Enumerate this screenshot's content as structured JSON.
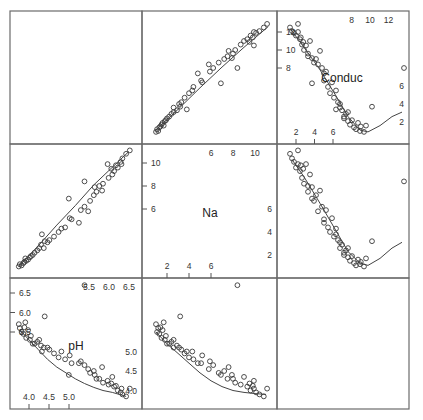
{
  "chart_data": {
    "type": "scatter",
    "subtype": "scatterplot-matrix",
    "title": "",
    "variables": [
      "Conduc",
      "Na",
      "pH"
    ],
    "diagonal_labels": [
      "Conduc",
      "Na",
      "pH"
    ],
    "smoother": "loess curve in each off-diagonal panel",
    "axes": {
      "Conduc": {
        "ticks_bottom": [
          "2",
          "4",
          "6"
        ],
        "ticks_top": [
          "8",
          "10",
          "12"
        ],
        "ticks_left": [
          "8",
          "10",
          "12"
        ],
        "ticks_right": [
          "2",
          "4",
          "6"
        ],
        "range": [
          0.5,
          13.5
        ]
      },
      "Na": {
        "ticks_bottom": [
          "2",
          "4",
          "6"
        ],
        "ticks_top": [
          "6",
          "8",
          "10"
        ],
        "ticks_left": [
          "6",
          "8",
          "10"
        ],
        "ticks_right": [
          "2",
          "4",
          "6"
        ],
        "range": [
          0.7,
          11.5
        ]
      },
      "pH": {
        "ticks_bottom": [
          "4.0",
          "4.5",
          "5.0"
        ],
        "ticks_top": [
          "5.5",
          "6.0",
          "6.5"
        ],
        "ticks_left": [
          "5.5",
          "6.0",
          "6.5"
        ],
        "ticks_right": [
          "4.0",
          "4.5",
          "5.0"
        ],
        "range": [
          3.7,
          6.8
        ]
      }
    },
    "observations": [
      {
        "pH": 3.85,
        "Na": 10.8,
        "Conduc": 12.5
      },
      {
        "pH": 3.9,
        "Na": 10.4,
        "Conduc": 12.1
      },
      {
        "pH": 3.95,
        "Na": 10.1,
        "Conduc": 11.9
      },
      {
        "pH": 4.0,
        "Na": 9.6,
        "Conduc": 11.6
      },
      {
        "pH": 4.05,
        "Na": 11.1,
        "Conduc": 12.9
      },
      {
        "pH": 4.05,
        "Na": 9.9,
        "Conduc": 12.0
      },
      {
        "pH": 4.1,
        "Na": 9.3,
        "Conduc": 11.2
      },
      {
        "pH": 4.12,
        "Na": 9.8,
        "Conduc": 11.4
      },
      {
        "pH": 4.15,
        "Na": 8.7,
        "Conduc": 10.6
      },
      {
        "pH": 4.18,
        "Na": 9.5,
        "Conduc": 10.9
      },
      {
        "pH": 4.2,
        "Na": 8.2,
        "Conduc": 10.0
      },
      {
        "pH": 4.25,
        "Na": 9.9,
        "Conduc": 10.5
      },
      {
        "pH": 4.3,
        "Na": 8.0,
        "Conduc": 9.6
      },
      {
        "pH": 4.3,
        "Na": 7.5,
        "Conduc": 9.3
      },
      {
        "pH": 4.35,
        "Na": 9.0,
        "Conduc": 11.0
      },
      {
        "pH": 4.4,
        "Na": 7.9,
        "Conduc": 9.1
      },
      {
        "pH": 4.45,
        "Na": 6.7,
        "Conduc": 8.6
      },
      {
        "pH": 4.5,
        "Na": 7.2,
        "Conduc": 9.0
      },
      {
        "pH": 4.55,
        "Na": 5.8,
        "Conduc": 8.4
      },
      {
        "pH": 4.6,
        "Na": 7.6,
        "Conduc": 9.9
      },
      {
        "pH": 4.65,
        "Na": 6.2,
        "Conduc": 8.0
      },
      {
        "pH": 4.7,
        "Na": 5.1,
        "Conduc": 6.6
      },
      {
        "pH": 4.75,
        "Na": 5.9,
        "Conduc": 7.6
      },
      {
        "pH": 4.8,
        "Na": 4.4,
        "Conduc": 5.9
      },
      {
        "pH": 4.85,
        "Na": 4.0,
        "Conduc": 5.2
      },
      {
        "pH": 4.9,
        "Na": 5.2,
        "Conduc": 6.4
      },
      {
        "pH": 4.95,
        "Na": 3.6,
        "Conduc": 4.7
      },
      {
        "pH": 5.0,
        "Na": 4.3,
        "Conduc": 5.5
      },
      {
        "pH": 5.05,
        "Na": 3.3,
        "Conduc": 4.2
      },
      {
        "pH": 5.1,
        "Na": 2.6,
        "Conduc": 3.6
      },
      {
        "pH": 5.1,
        "Na": 3.1,
        "Conduc": 4.0
      },
      {
        "pH": 5.15,
        "Na": 2.9,
        "Conduc": 3.3
      },
      {
        "pH": 5.2,
        "Na": 2.2,
        "Conduc": 2.6
      },
      {
        "pH": 5.2,
        "Na": 2.0,
        "Conduc": 2.4
      },
      {
        "pH": 5.25,
        "Na": 2.4,
        "Conduc": 2.9
      },
      {
        "pH": 5.3,
        "Na": 1.8,
        "Conduc": 2.1
      },
      {
        "pH": 5.3,
        "Na": 2.6,
        "Conduc": 3.1
      },
      {
        "pH": 5.35,
        "Na": 1.5,
        "Conduc": 1.7
      },
      {
        "pH": 5.4,
        "Na": 1.9,
        "Conduc": 2.2
      },
      {
        "pH": 5.45,
        "Na": 1.3,
        "Conduc": 1.4
      },
      {
        "pH": 5.5,
        "Na": 1.1,
        "Conduc": 1.2
      },
      {
        "pH": 5.55,
        "Na": 1.6,
        "Conduc": 1.9
      },
      {
        "pH": 5.6,
        "Na": 1.2,
        "Conduc": 1.0
      },
      {
        "pH": 5.62,
        "Na": 1.4,
        "Conduc": 1.5
      },
      {
        "pH": 5.7,
        "Na": 1.0,
        "Conduc": 0.9
      },
      {
        "pH": 5.75,
        "Na": 1.7,
        "Conduc": 1.6
      },
      {
        "pH": 5.9,
        "Na": 3.2,
        "Conduc": 3.7
      },
      {
        "pH": 5.0,
        "Na": 3.8,
        "Conduc": 3.4
      },
      {
        "pH": 4.4,
        "Na": 6.9,
        "Conduc": 6.3
      },
      {
        "pH": 4.7,
        "Na": 4.8,
        "Conduc": 7.4
      },
      {
        "pH": 6.7,
        "Na": 8.4,
        "Conduc": 8.0
      }
    ],
    "fits": {
      "Conduc_vs_pH": [
        [
          3.85,
          12.4
        ],
        [
          4.2,
          10.3
        ],
        [
          4.6,
          7.8
        ],
        [
          5.0,
          4.9
        ],
        [
          5.3,
          2.6
        ],
        [
          5.6,
          1.1
        ],
        [
          5.8,
          0.9
        ],
        [
          6.1,
          1.6
        ],
        [
          6.4,
          2.6
        ],
        [
          6.65,
          3.1
        ]
      ],
      "Conduc_vs_Na": [
        [
          0.9,
          1.0
        ],
        [
          3,
          3.4
        ],
        [
          5,
          5.8
        ],
        [
          7,
          8.1
        ],
        [
          9,
          10.3
        ],
        [
          11.2,
          12.6
        ]
      ],
      "Na_vs_pH": [
        [
          3.9,
          10.3
        ],
        [
          4.2,
          8.8
        ],
        [
          4.6,
          6.5
        ],
        [
          5.0,
          4.1
        ],
        [
          5.3,
          2.3
        ],
        [
          5.6,
          1.3
        ],
        [
          5.8,
          1.1
        ],
        [
          6.1,
          1.7
        ],
        [
          6.4,
          2.6
        ],
        [
          6.65,
          3.1
        ]
      ],
      "Na_vs_Conduc": [
        [
          0.9,
          1.0
        ],
        [
          3,
          2.8
        ],
        [
          5,
          4.6
        ],
        [
          7,
          6.3
        ],
        [
          9,
          8.1
        ],
        [
          12.8,
          11.0
        ]
      ],
      "pH_vs_Na": [
        [
          1.0,
          5.5
        ],
        [
          2,
          5.2
        ],
        [
          3,
          4.95
        ],
        [
          4,
          4.7
        ],
        [
          5,
          4.45
        ],
        [
          6,
          4.25
        ],
        [
          7,
          4.1
        ],
        [
          8,
          4.0
        ],
        [
          9,
          3.95
        ],
        [
          10,
          3.92
        ],
        [
          11,
          3.9
        ]
      ],
      "pH_vs_Conduc": [
        [
          1.0,
          5.55
        ],
        [
          2,
          5.3
        ],
        [
          3,
          5.05
        ],
        [
          4,
          4.8
        ],
        [
          5,
          4.6
        ],
        [
          6,
          4.45
        ],
        [
          7,
          4.3
        ],
        [
          8,
          4.18
        ],
        [
          9,
          4.08
        ],
        [
          10,
          4.0
        ],
        [
          11,
          3.95
        ],
        [
          12.5,
          3.85
        ]
      ]
    },
    "layout": {
      "grid": false,
      "legend": "none",
      "panels": "3x3"
    }
  }
}
